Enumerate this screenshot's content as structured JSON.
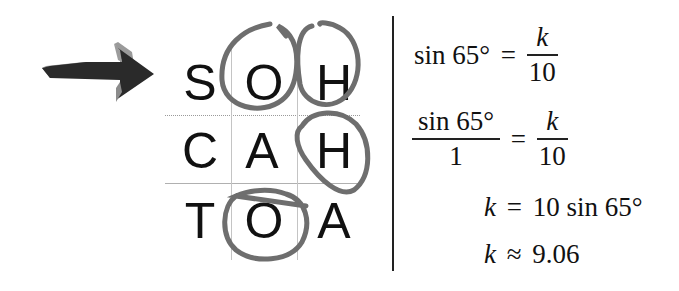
{
  "arrow": {
    "icon": "arrow-right-icon",
    "color": "#2a2a2a",
    "shade": "#8a8a8a"
  },
  "mnemonic": {
    "rows": [
      {
        "letters": [
          "S",
          "O",
          "H"
        ],
        "circled": [
          false,
          true,
          true
        ]
      },
      {
        "letters": [
          "C",
          "A",
          "H"
        ],
        "circled": [
          false,
          false,
          true
        ]
      },
      {
        "letters": [
          "T",
          "O",
          "A"
        ],
        "circled": [
          false,
          true,
          false
        ]
      }
    ],
    "circle_color": "#6e6e6e"
  },
  "equations": {
    "eq1": {
      "lhs": "sin 65°",
      "equals": "=",
      "rhs_num": "k",
      "rhs_den": "10"
    },
    "eq2": {
      "lhs_num": "sin 65°",
      "lhs_den": "1",
      "equals": "=",
      "rhs_num": "k",
      "rhs_den": "10"
    },
    "eq3": {
      "var": "k",
      "equals": "=",
      "rhs": "10 sin 65°"
    },
    "eq4": {
      "var": "k",
      "approx": "≈",
      "value": "9.06"
    }
  }
}
